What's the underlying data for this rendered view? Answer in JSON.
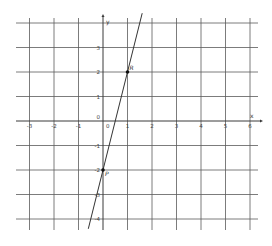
{
  "chart_data": {
    "type": "line",
    "title": "",
    "xlabel": "x",
    "ylabel": "y",
    "xlim": [
      -3.6,
      6.3
    ],
    "ylim": [
      -4.5,
      4.0
    ],
    "grid": true,
    "x_ticks": [
      -3,
      -2,
      -1,
      0,
      1,
      2,
      3,
      4,
      5,
      6
    ],
    "y_ticks": [
      -4,
      -3,
      -2,
      -1,
      0,
      1,
      2,
      3
    ],
    "x_tick_labels": [
      "-3",
      "-2",
      "-1",
      "0",
      "1",
      "2",
      "3",
      "4",
      "5",
      "6"
    ],
    "y_tick_labels": [
      "-4",
      "-3",
      "-2",
      "-1",
      "0",
      "1",
      "2",
      "3"
    ],
    "series": [
      {
        "name": "line through P and R",
        "equation": "y = 4x - 2",
        "x": [
          -0.6,
          1.6
        ],
        "y": [
          -4.4,
          4.4
        ]
      }
    ],
    "points": [
      {
        "label": "R",
        "x": 1,
        "y": 2
      },
      {
        "label": "P",
        "x": 0,
        "y": -2
      }
    ]
  },
  "labels": {
    "x_axis": "x",
    "y_axis": "y",
    "origin": "0",
    "point_r": "R",
    "point_p": "P"
  },
  "layout": {
    "origin_px": [
      103,
      121
    ],
    "unit_px": 24.5,
    "grid_left": 16,
    "grid_right": 258,
    "grid_top": 22,
    "grid_bottom": 230
  },
  "colors": {
    "grid": "#5a5a5a",
    "line": "#333333",
    "point": "#111111"
  }
}
